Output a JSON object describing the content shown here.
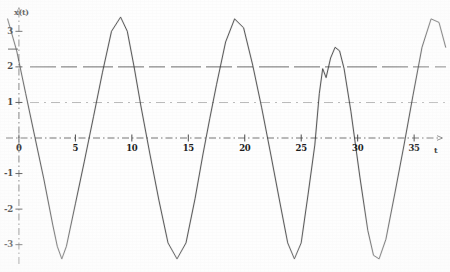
{
  "figure": {
    "kind": "scanned-line-plot",
    "ylabel": "x(t)",
    "xlabel": "t",
    "ink_color": "#3a3a3a",
    "grid_color": "#555555",
    "axis_color": "#4a4a4a",
    "background": "#fefefe"
  },
  "axes": {
    "y_ticks": [
      "3",
      "2",
      "1",
      "0",
      "-1",
      "-2",
      "-3"
    ],
    "y_tick_values": [
      3,
      2,
      1,
      0,
      -1,
      -2,
      -3
    ],
    "x_ticks": [
      "0",
      "5",
      "10",
      "15",
      "20",
      "25",
      "30",
      "35"
    ],
    "x_tick_values": [
      0,
      5,
      10,
      15,
      20,
      25,
      30,
      35
    ],
    "origin_label": "0",
    "x_axis_arrow": true,
    "y_axis_arrow": true,
    "axis_style": "dash-dot"
  },
  "reference_lines": [
    {
      "name": "level-2",
      "value": 2,
      "style": "long-dash",
      "weight": 1.0
    },
    {
      "name": "level-1",
      "value": 1,
      "style": "dash-dot",
      "weight": 0.7
    }
  ],
  "markers": [
    {
      "name": "left-tick-bar",
      "value": 2.5,
      "note": "short horizontal bar left of y-axis"
    }
  ],
  "chart_data": {
    "type": "line",
    "title": "",
    "xlabel": "t",
    "ylabel": "x(t)",
    "xlim": [
      -1.5,
      38
    ],
    "ylim": [
      -3.6,
      3.6
    ],
    "grid": false,
    "legend": "none",
    "series": [
      {
        "name": "x(t)",
        "description": "steep near-sawtooth oscillation, period about 7.2, amplitude about 3.3, with a clipped notched crest near t=27",
        "x": [
          -1.0,
          -0.2,
          0.6,
          1.4,
          2.2,
          3.0,
          3.4,
          3.8,
          4.2,
          5.0,
          5.8,
          6.6,
          7.4,
          8.2,
          9.0,
          9.6,
          10.2,
          10.8,
          11.6,
          12.4,
          13.2,
          14.0,
          14.8,
          15.6,
          16.3,
          16.9,
          17.5,
          18.3,
          19.1,
          19.9,
          20.7,
          21.5,
          22.3,
          23.1,
          23.8,
          24.4,
          25.0,
          25.6,
          26.2,
          26.6,
          26.9,
          27.2,
          27.6,
          28.0,
          28.4,
          28.8,
          29.4,
          30.2,
          30.9,
          31.4,
          31.9,
          32.5,
          33.3,
          34.1,
          34.9,
          35.7,
          36.5,
          37.2,
          37.8
        ],
        "y": [
          3.35,
          2.45,
          1.25,
          0.05,
          -1.15,
          -2.45,
          -3.05,
          -3.4,
          -3.05,
          -1.85,
          -0.65,
          0.6,
          1.85,
          3.0,
          3.4,
          3.0,
          2.0,
          0.9,
          -0.45,
          -1.75,
          -2.95,
          -3.4,
          -2.95,
          -1.7,
          -0.45,
          0.55,
          1.5,
          2.7,
          3.35,
          3.1,
          2.05,
          0.85,
          -0.45,
          -1.8,
          -2.95,
          -3.4,
          -2.95,
          -1.6,
          -0.2,
          1.25,
          1.95,
          1.7,
          2.25,
          2.55,
          2.45,
          1.95,
          0.75,
          -1.1,
          -2.6,
          -3.3,
          -3.4,
          -2.85,
          -1.55,
          -0.2,
          1.2,
          2.55,
          3.35,
          3.25,
          2.55
        ]
      }
    ]
  }
}
